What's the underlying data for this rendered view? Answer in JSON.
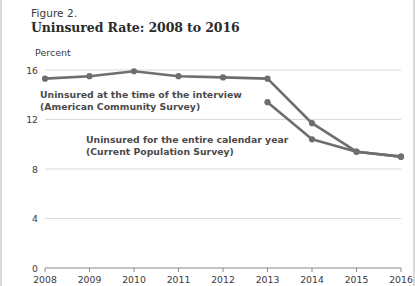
{
  "figure": {
    "number": "Figure 2.",
    "title": "Uninsured Rate: 2008 to 2016",
    "unit_label": "Percent"
  },
  "labels": {
    "acs_line1": "Uninsured at the time of the interview",
    "acs_line2": "(American Community Survey)",
    "cps_line1": "Uninsured for the entire calendar year",
    "cps_line2": "(Current Population Survey)"
  },
  "colors": {
    "line": "#6e6e6e",
    "marker": "#6e6e6e",
    "grid": "#d9d9d9",
    "axis": "#8a8a8a",
    "text": "#3a3a3a",
    "title": "#2b2b2b",
    "label": "#4a4a4a",
    "page_border": "#d8d8d8",
    "background": "#ffffff"
  },
  "chart_data": {
    "type": "line",
    "title": "Uninsured Rate: 2008 to 2016",
    "subtitle": "Figure 2.",
    "xlabel": "",
    "ylabel": "Percent",
    "ylim": [
      0,
      16
    ],
    "yticks": [
      0,
      4,
      8,
      12,
      16
    ],
    "ytick_labels": [
      "0",
      "4",
      "8",
      "12",
      "16"
    ],
    "grid": true,
    "legend": "inline-annotations",
    "categories": [
      2008,
      2009,
      2010,
      2011,
      2012,
      2013,
      2014,
      2015,
      2016
    ],
    "xtick_labels": [
      "2008",
      "2009",
      "2010",
      "2011",
      "2012",
      "2013",
      "2014",
      "2015",
      "2016"
    ],
    "series": [
      {
        "name": "Uninsured at the time of the interview (American Community Survey)",
        "short_name": "ACS",
        "values": [
          15.3,
          15.5,
          15.9,
          15.5,
          15.4,
          15.3,
          11.7,
          9.4,
          9.0
        ]
      },
      {
        "name": "Uninsured for the entire calendar year (Current Population Survey)",
        "short_name": "CPS",
        "values": [
          null,
          null,
          null,
          null,
          null,
          13.4,
          10.4,
          9.4,
          9.0
        ]
      }
    ],
    "annotations": [
      {
        "text": "Uninsured at the time of the interview (American Community Survey)",
        "target_series": "ACS"
      },
      {
        "text": "Uninsured for the entire calendar year (Current Population Survey)",
        "target_series": "CPS"
      }
    ]
  }
}
